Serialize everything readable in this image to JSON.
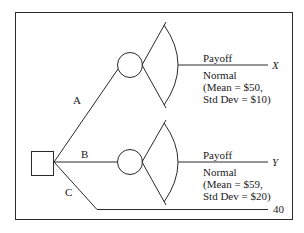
{
  "diagram": {
    "type": "decision-tree",
    "decision_node": {
      "shape": "square"
    },
    "branches": [
      {
        "label": "A",
        "chance_node": {
          "shape": "circle"
        },
        "payoff_label": "Payoff",
        "payoff_variable": "X",
        "distribution": {
          "name": "Normal",
          "mean_line": "(Mean = $50,",
          "std_line": "Std Dev = $10)"
        }
      },
      {
        "label": "B",
        "chance_node": {
          "shape": "circle"
        },
        "payoff_label": "Payoff",
        "payoff_variable": "Y",
        "distribution": {
          "name": "Normal",
          "mean_line": "(Mean = $59,",
          "std_line": "Std Dev = $20)"
        }
      },
      {
        "label": "C",
        "payoff_value": "40"
      }
    ]
  }
}
